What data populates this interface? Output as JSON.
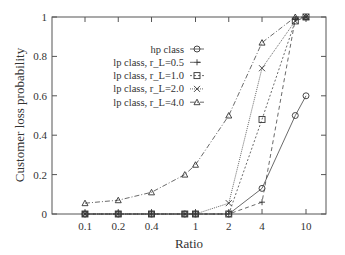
{
  "chart_data": {
    "type": "line",
    "title": "",
    "xlabel": "Ratio",
    "ylabel": "Customer loss probability",
    "xscale": "log",
    "x": [
      0.1,
      0.2,
      0.4,
      0.8,
      1,
      2,
      4,
      8,
      10
    ],
    "xticks": [
      "0.1",
      "0.2",
      "0.4",
      "1",
      "2",
      "4",
      "10"
    ],
    "xtick_values": [
      0.1,
      0.2,
      0.4,
      1,
      2,
      4,
      10
    ],
    "yticks": [
      "0",
      "0.2",
      "0.4",
      "0.6",
      "0.8",
      "1"
    ],
    "ylim": [
      0,
      1
    ],
    "legend_position": "upper-center",
    "series": [
      {
        "name": "hp class",
        "marker": "diamond",
        "dash": "",
        "values": [
          0,
          0,
          0,
          0,
          0,
          0,
          0.13,
          0.5,
          0.6
        ]
      },
      {
        "name": "lp class, r_L=0.5",
        "marker": "plus",
        "dash": "4,3",
        "values": [
          0,
          0,
          0,
          0,
          0,
          0,
          0.06,
          0.99,
          1.0
        ]
      },
      {
        "name": "lp class, r_L=1.0",
        "marker": "square",
        "dash": "2,2",
        "values": [
          0,
          0,
          0,
          0,
          0,
          0,
          0.48,
          0.98,
          1.0
        ]
      },
      {
        "name": "lp class, r_L=2.0",
        "marker": "cross",
        "dash": "1,1",
        "values": [
          0,
          0,
          0,
          0,
          0,
          0.055,
          0.74,
          0.98,
          1.0
        ]
      },
      {
        "name": "lp class, r_L=4.0",
        "marker": "triangle",
        "dash": "5,2,1,2",
        "values": [
          0.055,
          0.07,
          0.11,
          0.2,
          0.25,
          0.5,
          0.87,
          1.0,
          1.0
        ]
      }
    ]
  },
  "legend": {
    "items": [
      "hp class",
      "lp class, r_L=0.5",
      "lp class, r_L=1.0",
      "lp class, r_L=2.0",
      "lp class, r_L=4.0"
    ]
  },
  "axes": {
    "xlabel": "Ratio",
    "ylabel": "Customer loss probability"
  }
}
